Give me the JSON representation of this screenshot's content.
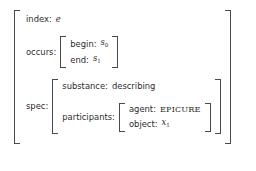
{
  "figure": {
    "type": "attribute-value-matrix",
    "ink_color": "#2b2b2b",
    "bracket_color": "#4a4a4a",
    "background": "#ffffff"
  },
  "avm": {
    "index": {
      "attr": "index:",
      "value": "e",
      "value_style": "math-italic"
    },
    "occurs": {
      "attr": "occurs:",
      "begin": {
        "attr": "begin:",
        "value": "s",
        "subscript": "0",
        "value_style": "math-italic"
      },
      "end": {
        "attr": "end:",
        "value": "s",
        "subscript": "1",
        "value_style": "math-italic"
      }
    },
    "spec": {
      "attr": "spec:",
      "substance": {
        "attr": "substance:",
        "value": "describing",
        "value_style": "word"
      },
      "participants": {
        "attr": "participants:",
        "agent": {
          "attr": "agent:",
          "value": "EPICURE",
          "value_style": "small-caps"
        },
        "object": {
          "attr": "object:",
          "value": "x",
          "subscript": "1",
          "value_style": "math-italic"
        }
      }
    }
  }
}
